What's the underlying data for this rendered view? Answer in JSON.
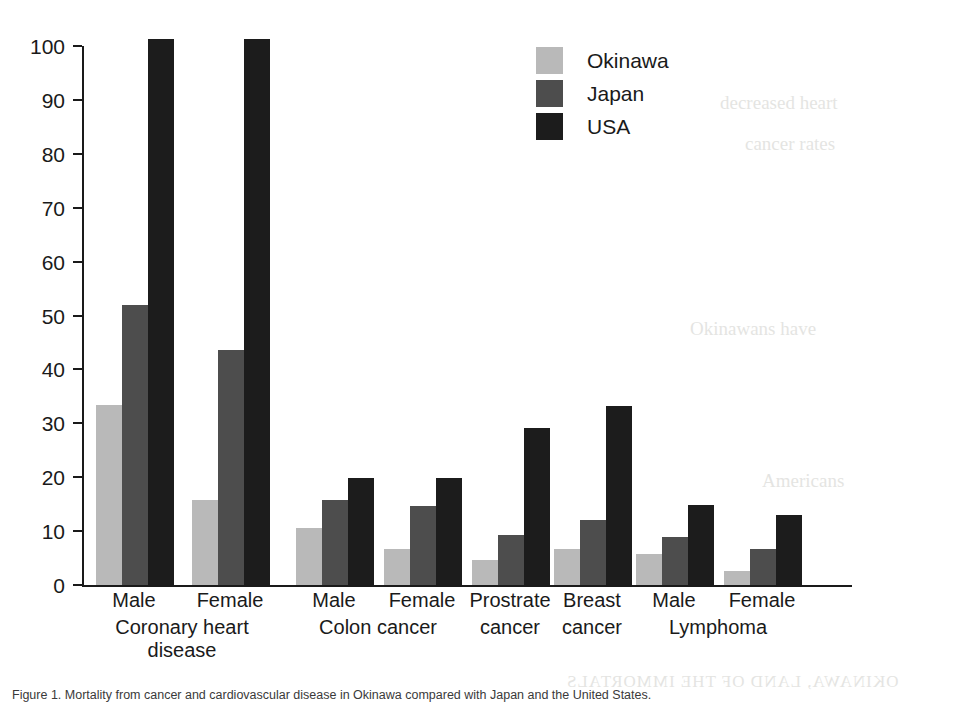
{
  "legend": {
    "position": "top-right",
    "entries": [
      {
        "label": "Okinawa",
        "color": "#b9b9b9"
      },
      {
        "label": "Japan",
        "color": "#4d4d4d"
      },
      {
        "label": "USA",
        "color": "#1c1c1c"
      }
    ]
  },
  "axis": {
    "y_ticks": [
      "0",
      "10",
      "20",
      "30",
      "40",
      "50",
      "60",
      "70",
      "80",
      "90",
      "100"
    ]
  },
  "caption": {
    "text": "Figure 1. Mortality from cancer and cardiovascular disease in Okinawa compared with Japan and the United States."
  },
  "bleed": {
    "l1": "decreased heart",
    "l2": "cancer rates",
    "l3": "Okinawans have",
    "l4": "Americans",
    "l5": "OKINAWA, LAND OF THE IMMORTALS"
  },
  "chart_data": {
    "type": "bar",
    "title": "",
    "xlabel": "",
    "ylabel": "",
    "ylim": [
      0,
      100
    ],
    "yticks": [
      0,
      10,
      20,
      30,
      40,
      50,
      60,
      70,
      80,
      90,
      100
    ],
    "grid": false,
    "legend_position": "top-right",
    "categories": [
      "Coronary heart disease - Male",
      "Coronary heart disease - Female",
      "Colon cancer - Male",
      "Colon cancer - Female",
      "Prostrate cancer",
      "Breast cancer",
      "Lymphoma - Male",
      "Lymphoma - Female"
    ],
    "group_labels": [
      {
        "sub": "Male",
        "main": "Coronary heart\ndisease"
      },
      {
        "sub": "Female",
        "main": ""
      },
      {
        "sub": "Male",
        "main": "Colon cancer"
      },
      {
        "sub": "Female",
        "main": ""
      },
      {
        "sub": "Prostrate",
        "main": "cancer"
      },
      {
        "sub": "Breast",
        "main": "cancer"
      },
      {
        "sub": "Male",
        "main": "Lymphoma"
      },
      {
        "sub": "Female",
        "main": ""
      }
    ],
    "series": [
      {
        "name": "Okinawa",
        "color": "#b9b9b9",
        "values": [
          33.4,
          15.7,
          10.6,
          6.6,
          4.6,
          6.7,
          5.7,
          2.6
        ]
      },
      {
        "name": "Japan",
        "color": "#4d4d4d",
        "values": [
          52.0,
          43.6,
          15.8,
          14.6,
          9.3,
          12.1,
          8.9,
          6.7
        ]
      },
      {
        "name": "USA",
        "color": "#1c1c1c",
        "values": [
          101.9,
          101.9,
          19.9,
          19.8,
          29.1,
          33.2,
          14.8,
          13.0
        ]
      }
    ],
    "clipped_series_note": "USA coronary heart disease bars extend past the top of the 0-100 axis"
  }
}
